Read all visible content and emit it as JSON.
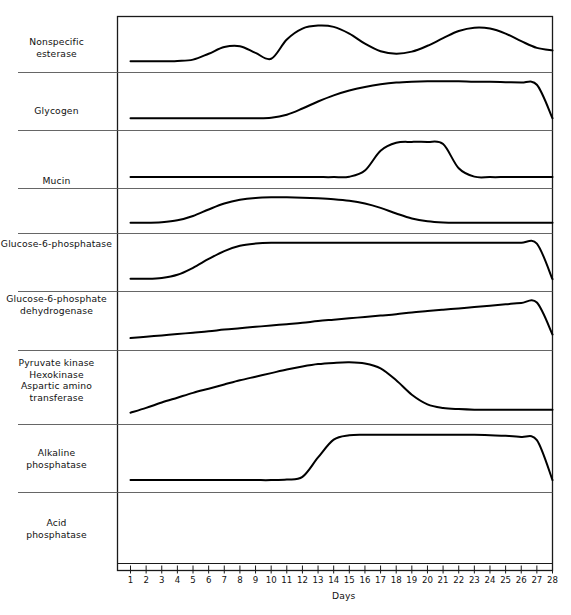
{
  "figure": {
    "axis_title": "Days",
    "x_axis": {
      "label": "Days",
      "min": 1,
      "max": 28,
      "ticks": [
        1,
        2,
        3,
        4,
        5,
        6,
        7,
        8,
        9,
        10,
        11,
        12,
        13,
        14,
        15,
        16,
        17,
        18,
        19,
        20,
        21,
        22,
        23,
        24,
        25,
        26,
        27,
        28
      ],
      "tick_labels": [
        "1",
        "2",
        "3",
        "4",
        "5",
        "6",
        "7",
        "8",
        "9",
        "10",
        "11",
        "12",
        "13",
        "14",
        "15",
        "16",
        "17",
        "18",
        "19",
        "20",
        "21",
        "22",
        "23",
        "24",
        "25",
        "26",
        "27",
        "28"
      ]
    },
    "colors": {
      "curve": "#000000",
      "frame": "#1a1a1a",
      "divider": "#555555",
      "background": "#ffffff"
    }
  },
  "panels": [
    {
      "id": "nonspecific-esterase",
      "label_lines": [
        "Nonspecific",
        "esterase"
      ],
      "label": "Nonspecific esterase"
    },
    {
      "id": "glycogen",
      "label_lines": [
        "Glycogen"
      ],
      "label": "Glycogen"
    },
    {
      "id": "mucin",
      "label_lines": [
        "Mucin"
      ],
      "label": "Mucin"
    },
    {
      "id": "glucose-6-phosphatase",
      "label_lines": [
        "Glucose-6-phosphatase"
      ],
      "label": "Glucose-6-phosphatase"
    },
    {
      "id": "glucose-6-phosphate-dehydrogenase",
      "label_lines": [
        "Glucose-6-phosphate",
        "dehydrogenase"
      ],
      "label": "Glucose-6-phosphate dehydrogenase"
    },
    {
      "id": "pyruvate-kinase-group",
      "label_lines": [
        "Pyruvate kinase",
        "Hexokinase",
        "Aspartic amino",
        "transferase"
      ],
      "label": "Pyruvate kinase Hexokinase Aspartic amino transferase"
    },
    {
      "id": "alkaline-phosphatase",
      "label_lines": [
        "Alkaline",
        "phosphatase"
      ],
      "label": "Alkaline phosphatase"
    },
    {
      "id": "acid-phosphatase",
      "label_lines": [
        "Acid",
        "phosphatase"
      ],
      "label": "Acid phosphatase"
    }
  ],
  "chart_data": {
    "type": "line",
    "title": "",
    "xlabel": "Days",
    "ylabel": "",
    "xlim": [
      1,
      28
    ],
    "grid": false,
    "legend": "none",
    "note": "Eight stacked sub-panels, each an unscaled relative-activity trace versus time in days. Values are relative activity 0-1 within each panel.",
    "x": [
      1,
      2,
      3,
      4,
      5,
      6,
      7,
      8,
      9,
      10,
      11,
      12,
      13,
      14,
      15,
      16,
      17,
      18,
      19,
      20,
      21,
      22,
      23,
      24,
      25,
      26,
      27,
      28
    ],
    "series": [
      {
        "name": "Nonspecific esterase",
        "panel": "nonspecific-esterase",
        "values": [
          0.1,
          0.1,
          0.1,
          0.11,
          0.14,
          0.28,
          0.44,
          0.46,
          0.3,
          0.16,
          0.62,
          0.88,
          0.95,
          0.92,
          0.76,
          0.52,
          0.34,
          0.28,
          0.33,
          0.47,
          0.65,
          0.82,
          0.9,
          0.88,
          0.76,
          0.58,
          0.42,
          0.36
        ]
      },
      {
        "name": "Glycogen",
        "panel": "glycogen",
        "values": [
          0.12,
          0.12,
          0.12,
          0.12,
          0.12,
          0.12,
          0.12,
          0.12,
          0.12,
          0.13,
          0.2,
          0.34,
          0.5,
          0.64,
          0.75,
          0.83,
          0.89,
          0.93,
          0.95,
          0.96,
          0.96,
          0.96,
          0.95,
          0.95,
          0.94,
          0.93,
          0.88,
          0.12
        ]
      },
      {
        "name": "Mucin",
        "panel": "mucin",
        "values": [
          0.1,
          0.1,
          0.1,
          0.1,
          0.1,
          0.1,
          0.1,
          0.1,
          0.1,
          0.1,
          0.1,
          0.1,
          0.1,
          0.1,
          0.11,
          0.25,
          0.7,
          0.88,
          0.9,
          0.9,
          0.85,
          0.3,
          0.11,
          0.1,
          0.1,
          0.1,
          0.1,
          0.1
        ]
      },
      {
        "name": "Glucose-6-phosphatase",
        "panel": "glucose-6-phosphatase",
        "values": [
          0.12,
          0.12,
          0.14,
          0.2,
          0.34,
          0.55,
          0.74,
          0.86,
          0.92,
          0.94,
          0.94,
          0.93,
          0.91,
          0.88,
          0.83,
          0.74,
          0.6,
          0.42,
          0.26,
          0.17,
          0.13,
          0.12,
          0.12,
          0.12,
          0.12,
          0.12,
          0.12,
          0.12
        ]
      },
      {
        "name": "Glucose-6-phosphate dehydrogenase",
        "panel": "glucose-6-phosphate-dehydrogenase",
        "values": [
          0.13,
          0.13,
          0.15,
          0.22,
          0.38,
          0.58,
          0.76,
          0.88,
          0.93,
          0.95,
          0.95,
          0.95,
          0.95,
          0.95,
          0.95,
          0.95,
          0.95,
          0.95,
          0.95,
          0.95,
          0.95,
          0.95,
          0.95,
          0.95,
          0.95,
          0.95,
          0.93,
          0.12
        ]
      },
      {
        "name": "Pyruvate kinase / Hexokinase / Aspartic amino transferase",
        "panel": "pyruvate-kinase-group",
        "values": [
          0.12,
          0.15,
          0.18,
          0.21,
          0.24,
          0.27,
          0.31,
          0.34,
          0.37,
          0.4,
          0.43,
          0.46,
          0.5,
          0.53,
          0.56,
          0.59,
          0.62,
          0.65,
          0.69,
          0.72,
          0.75,
          0.78,
          0.81,
          0.84,
          0.87,
          0.9,
          0.91,
          0.2
        ]
      },
      {
        "name": "Alkaline phosphatase",
        "panel": "alkaline-phosphatase",
        "values": [
          0.08,
          0.16,
          0.25,
          0.33,
          0.41,
          0.48,
          0.55,
          0.62,
          0.68,
          0.74,
          0.8,
          0.85,
          0.89,
          0.91,
          0.92,
          0.9,
          0.82,
          0.62,
          0.38,
          0.22,
          0.16,
          0.14,
          0.13,
          0.13,
          0.13,
          0.13,
          0.13,
          0.13
        ]
      },
      {
        "name": "Acid phosphatase",
        "panel": "acid-phosphatase",
        "values": [
          0.1,
          0.1,
          0.1,
          0.1,
          0.1,
          0.1,
          0.1,
          0.1,
          0.1,
          0.1,
          0.11,
          0.16,
          0.52,
          0.85,
          0.93,
          0.94,
          0.94,
          0.94,
          0.94,
          0.94,
          0.94,
          0.94,
          0.94,
          0.93,
          0.92,
          0.9,
          0.84,
          0.1
        ]
      }
    ]
  }
}
